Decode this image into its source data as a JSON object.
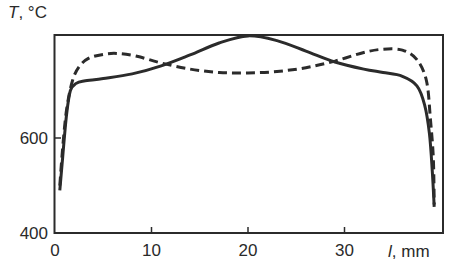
{
  "chart_data": {
    "type": "line",
    "title": "",
    "xlabel": "l, mm",
    "xlabel_var": "l",
    "xlabel_unit": ", mm",
    "ylabel": "T, °C",
    "ylabel_var": "T",
    "ylabel_unit": ", °C",
    "xlim": [
      0,
      40.5
    ],
    "ylim": [
      400,
      817
    ],
    "xticks": [
      0,
      10,
      20,
      30
    ],
    "xtick_labels": [
      "0",
      "10",
      "20",
      "30"
    ],
    "yticks": [
      400,
      600
    ],
    "ytick_labels": [
      "400",
      "600"
    ],
    "grid": false,
    "legend": null,
    "series": [
      {
        "name": "solid",
        "style": "solid",
        "color": "#2b2b2b",
        "x": [
          0.5,
          0.8,
          1.2,
          1.6,
          2.2,
          3,
          5,
          8,
          11,
          14,
          17,
          20,
          23,
          26,
          29,
          32,
          34,
          36,
          37.5,
          38.3,
          38.8,
          39.1,
          39.3
        ],
        "y": [
          490,
          560,
          650,
          700,
          715,
          720,
          725,
          735,
          752,
          775,
          800,
          815,
          805,
          783,
          760,
          745,
          738,
          730,
          710,
          670,
          610,
          530,
          455
        ]
      },
      {
        "name": "dashed",
        "style": "dashed",
        "color": "#2b2b2b",
        "x": [
          0.5,
          0.8,
          1.2,
          1.8,
          2.5,
          3.5,
          5,
          6.5,
          8.5,
          11,
          14,
          17,
          20,
          23,
          26,
          29,
          32,
          34,
          36,
          37.5,
          38.5,
          38.9,
          39.2,
          39.3
        ],
        "y": [
          500,
          580,
          660,
          720,
          750,
          768,
          776,
          778,
          772,
          758,
          745,
          738,
          737,
          740,
          748,
          762,
          780,
          787,
          785,
          765,
          720,
          640,
          560,
          460
        ]
      }
    ]
  }
}
